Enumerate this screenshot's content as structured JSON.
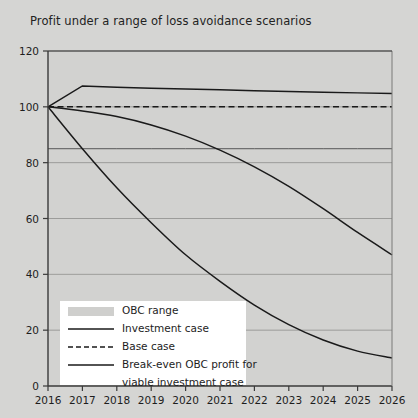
{
  "chart_data": {
    "type": "line",
    "title": "Profit under a range of loss avoidance scenarios",
    "xlabel": "",
    "ylabel": "",
    "x": [
      2016,
      2017,
      2018,
      2019,
      2020,
      2021,
      2022,
      2023,
      2024,
      2025,
      2026
    ],
    "xtick_labels": [
      "2016",
      "2017",
      "2018",
      "2019",
      "2020",
      "2021",
      "2022",
      "2023",
      "2024",
      "2025",
      "2026"
    ],
    "ytick_labels": [
      "0",
      "20",
      "40",
      "60",
      "80",
      "100",
      "120"
    ],
    "yticks": [
      0,
      20,
      40,
      60,
      80,
      100,
      120
    ],
    "ylim": [
      0,
      120
    ],
    "xlim": [
      2016,
      2026
    ],
    "grid": true,
    "grid_axis": "y",
    "legend_position": "lower-left",
    "series": [
      {
        "name": "OBC range",
        "style": "band",
        "color": "#cfcfcd",
        "values": [
          100,
          100,
          100,
          100,
          100,
          100,
          100,
          100,
          100,
          100,
          100
        ]
      },
      {
        "name": "Investment case",
        "style": "solid",
        "color": "#1a1a1a",
        "values": [
          100,
          107.5,
          107,
          106.7,
          106.4,
          106.1,
          105.8,
          105.5,
          105.2,
          105,
          104.8
        ]
      },
      {
        "name": "Base case",
        "style": "dashed",
        "color": "#1a1a1a",
        "values": [
          100,
          100,
          100,
          100,
          100,
          100,
          100,
          100,
          100,
          100,
          100
        ]
      },
      {
        "name": "Break-even OBC profit for viable investment case",
        "style": "solid-thin",
        "color": "#4a4a4a",
        "values": [
          85,
          85,
          85,
          85,
          85,
          85,
          85,
          85,
          85,
          85,
          85
        ]
      },
      {
        "name": "Investment case decline",
        "style": "solid",
        "color": "#1a1a1a",
        "values": [
          100,
          98.5,
          96.5,
          93.5,
          89.5,
          84.5,
          78.5,
          71.5,
          63.5,
          55,
          47
        ]
      },
      {
        "name": "OBC profit decline",
        "style": "solid",
        "color": "#1a1a1a",
        "values": [
          100,
          85,
          71,
          58.5,
          47,
          37.5,
          29,
          22,
          16.5,
          12.5,
          10
        ]
      }
    ],
    "legend_entries": [
      {
        "label": "OBC range",
        "marker": "swatch"
      },
      {
        "label": "Investment case",
        "marker": "solid-line"
      },
      {
        "label": "Base case",
        "marker": "dashed-line"
      },
      {
        "label": "Break-even OBC profit for",
        "marker": "solid-line"
      },
      {
        "label": "viable investment case",
        "marker": "none"
      }
    ],
    "colors": {
      "background": "#d5d5d3",
      "plot_background": "#d2d2d0",
      "axis": "#3a3a3a",
      "gridline": "#8e8e8c",
      "line": "#1a1a1a",
      "legend_background": "#ffffff",
      "band": "#cfcfcd"
    }
  }
}
